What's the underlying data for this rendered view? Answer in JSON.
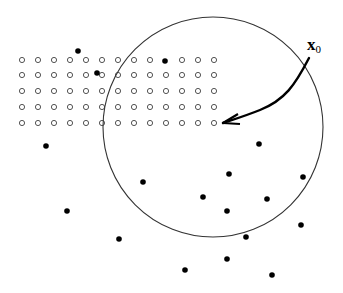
{
  "diagram": {
    "label": {
      "main": "x",
      "subscript": "0"
    },
    "colors": {
      "stroke": "#000000",
      "open_point_stroke": "#555555",
      "background": "#ffffff"
    },
    "circle": {
      "cx": 213,
      "cy": 127,
      "r": 110
    },
    "grid": {
      "columns_x": [
        22,
        38,
        54,
        70,
        86,
        102,
        118,
        134,
        150,
        166,
        182,
        198,
        214
      ],
      "rows_y": [
        60,
        75,
        91,
        107,
        123
      ],
      "open_point_radius": 2.6,
      "omitted": [
        [
          166,
          60
        ]
      ]
    },
    "filled_points": [
      [
        78,
        51
      ],
      [
        97,
        73
      ],
      [
        165,
        61
      ],
      [
        46,
        146
      ],
      [
        259,
        144
      ],
      [
        143,
        182
      ],
      [
        229,
        174
      ],
      [
        303,
        177
      ],
      [
        203,
        197
      ],
      [
        267,
        199
      ],
      [
        227,
        211
      ],
      [
        67,
        211
      ],
      [
        301,
        225
      ],
      [
        119,
        239
      ],
      [
        246,
        237
      ],
      [
        227,
        259
      ],
      [
        185,
        270
      ],
      [
        272,
        275
      ]
    ],
    "arrow": {
      "path": "M 309 58 C 295 85, 285 100, 260 110 C 245 116, 235 119, 223 123",
      "head": [
        [
          223,
          123
        ],
        [
          238,
          114
        ],
        [
          240,
          124
        ]
      ]
    }
  }
}
